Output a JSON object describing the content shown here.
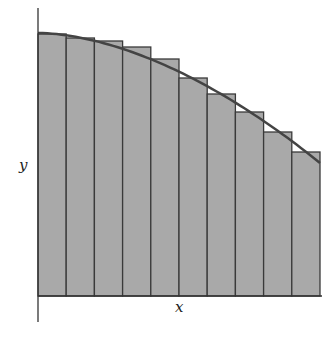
{
  "diagram": {
    "title": "",
    "type": "riemann-sum-rectangles",
    "x_label": "x",
    "y_label": "y",
    "colors": {
      "bar_fill": "#a9a9a9",
      "bar_stroke": "#3a3a3a",
      "curve": "#444444",
      "axis": "#333333"
    },
    "rectangle_count": 10
  },
  "chart_data": {
    "type": "bar",
    "title": "",
    "xlabel": "x",
    "ylabel": "y",
    "categories": [
      "1",
      "2",
      "3",
      "4",
      "5",
      "6",
      "7",
      "8",
      "9",
      "10"
    ],
    "values": [
      262,
      258,
      255,
      249,
      237,
      218,
      202,
      184,
      164,
      144
    ],
    "curve": "decreasing concave-down function overlaid on left-endpoint rectangles",
    "grid": false,
    "ticks": false
  }
}
